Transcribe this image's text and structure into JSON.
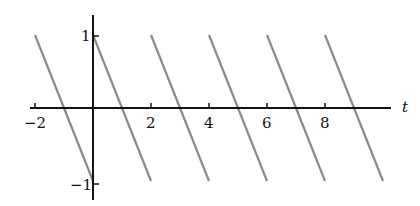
{
  "chart_data": {
    "type": "line",
    "title": "",
    "xlabel": "t",
    "ylabel": "",
    "xlim": [
      -2.2,
      10.5
    ],
    "ylim": [
      -1.25,
      1.25
    ],
    "x_ticks": [
      "-2",
      "2",
      "4",
      "6",
      "8"
    ],
    "y_ticks": [
      "1",
      "-1"
    ],
    "grid": false,
    "legend": null,
    "series": [
      {
        "name": "segment 1",
        "x": [
          -2,
          0
        ],
        "y": [
          1,
          -1
        ]
      },
      {
        "name": "segment 2",
        "x": [
          0,
          2
        ],
        "y": [
          1,
          -1
        ]
      },
      {
        "name": "segment 3",
        "x": [
          2,
          4
        ],
        "y": [
          1,
          -1
        ]
      },
      {
        "name": "segment 4",
        "x": [
          4,
          6
        ],
        "y": [
          1,
          -1
        ]
      },
      {
        "name": "segment 5",
        "x": [
          6,
          8
        ],
        "y": [
          1,
          -1
        ]
      },
      {
        "name": "segment 6",
        "x": [
          8,
          10
        ],
        "y": [
          1,
          -1
        ]
      }
    ],
    "line_color": "#8a8a8a",
    "axis_color": "#111111"
  },
  "labels": {
    "x_axis": "t",
    "tick_neg2": "−2",
    "tick_2": "2",
    "tick_4": "4",
    "tick_6": "6",
    "tick_8": "8",
    "tick_1": "1",
    "tick_neg1": "−1"
  }
}
